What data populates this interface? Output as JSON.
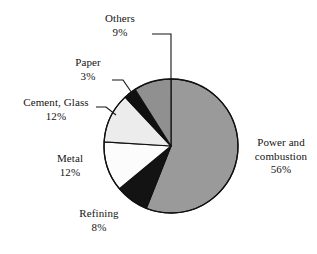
{
  "chart_data": {
    "type": "pie",
    "title": "",
    "subtitle": "",
    "xlabel": "",
    "ylabel": "",
    "legend_position": "none",
    "grid": false,
    "units": "percent",
    "start_angle_deg": 0,
    "direction": "clockwise",
    "categories": [
      "Power and combustion",
      "Refining",
      "Metal",
      "Cement, Glass",
      "Paper",
      "Others"
    ],
    "values": [
      56,
      8,
      12,
      12,
      3,
      9
    ],
    "slices": [
      {
        "id": "power-and-combustion",
        "label": "Power and",
        "label_line2": "combustion",
        "value": 56,
        "value_text": "56%",
        "color": "#9a9a9a",
        "stroke": "#111111",
        "leader": false
      },
      {
        "id": "refining",
        "label": "Refining",
        "value": 8,
        "value_text": "8%",
        "color": "#131313",
        "stroke": "#111111",
        "leader": false
      },
      {
        "id": "metal",
        "label": "Metal",
        "value": 12,
        "value_text": "12%",
        "color": "#fcfcfc",
        "stroke": "#111111",
        "leader": false
      },
      {
        "id": "cement-glass",
        "label": "Cement, Glass",
        "value": 12,
        "value_text": "12%",
        "color": "#ececec",
        "stroke": "#111111",
        "leader": true
      },
      {
        "id": "paper",
        "label": "Paper",
        "value": 3,
        "value_text": "3%",
        "color": "#101010",
        "stroke": "#111111",
        "leader": true
      },
      {
        "id": "others",
        "label": "Others",
        "value": 9,
        "value_text": "9%",
        "color": "#909090",
        "stroke": "#111111",
        "leader": true
      }
    ]
  },
  "labels": {
    "others": {
      "name": "Others",
      "value": "9%"
    },
    "paper": {
      "name": "Paper",
      "value": "3%"
    },
    "cement_glass": {
      "name": "Cement, Glass",
      "value": "12%"
    },
    "metal": {
      "name": "Metal",
      "value": "12%"
    },
    "refining": {
      "name": "Refining",
      "value": "8%"
    },
    "power": {
      "name_line1": "Power and",
      "name_line2": "combustion",
      "value": "56%"
    }
  },
  "geometry": {
    "center_x": 171,
    "center_y": 146,
    "radius": 67
  },
  "colors": {
    "background": "#ffffff",
    "outline": "#111111",
    "text": "#141414",
    "gray_large": "#9a9a9a",
    "gray_others": "#909090",
    "light": "#ececec",
    "white": "#fcfcfc",
    "black": "#101010"
  }
}
